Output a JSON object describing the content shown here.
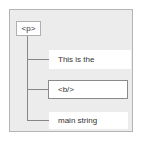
{
  "diagram": {
    "type": "tree",
    "root": {
      "label": "<p>"
    },
    "children": [
      {
        "label": "This is the",
        "style": "plain"
      },
      {
        "label": "<b/>",
        "style": "bordered"
      },
      {
        "label": "main string",
        "style": "plain"
      }
    ]
  },
  "colors": {
    "panel_bg": "#ececec",
    "panel_border": "#b4b4b4",
    "node_bg": "#ffffff",
    "connector": "#888888"
  }
}
